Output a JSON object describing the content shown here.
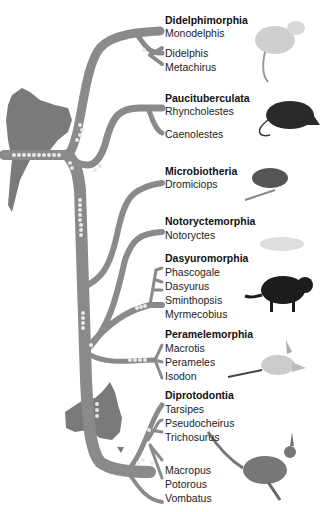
{
  "colors": {
    "branch": "#8a8a8a",
    "continent": "#7a7a7a",
    "dots": "#e8e8e8",
    "text": "#222222"
  },
  "continents": [
    "South America",
    "Australia"
  ],
  "orders": [
    {
      "name": "Didelphimorphia",
      "genera": [
        "Monodelphis",
        "Didelphis",
        "Metachirus"
      ],
      "animal": "opossum"
    },
    {
      "name": "Paucituberculata",
      "genera": [
        "Rhyncholestes",
        "Caenolestes"
      ],
      "animal": "shrew-opossum"
    },
    {
      "name": "Microbiotheria",
      "genera": [
        "Dromiciops"
      ],
      "animal": "monito-del-monte"
    },
    {
      "name": "Notoryctemorphia",
      "genera": [
        "Notoryctes"
      ],
      "animal": "marsupial-mole"
    },
    {
      "name": "Dasyuromorphia",
      "genera": [
        "Phascogale",
        "Dasyurus",
        "Sminthopsis",
        "Myrmecobius"
      ],
      "animal": "tasmanian-devil"
    },
    {
      "name": "Peramelemorphia",
      "genera": [
        "Macrotis",
        "Perameles",
        "Isodon"
      ],
      "animal": "bilby"
    },
    {
      "name": "Diprotodontia",
      "genera": [
        "Tarsipes",
        "Pseudocheirus",
        "Trichosurus",
        "Macropus",
        "Potorous",
        "Vombatus"
      ],
      "animal": "kangaroo"
    }
  ]
}
